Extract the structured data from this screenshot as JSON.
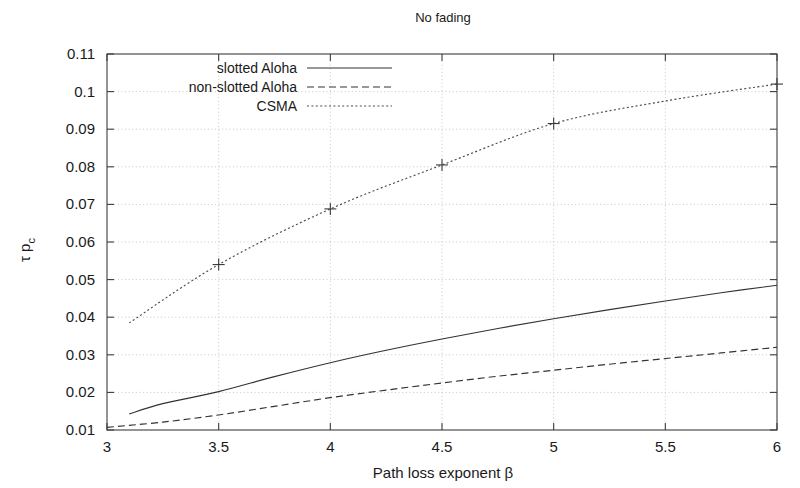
{
  "chart_data": {
    "type": "line",
    "title": "No fading",
    "xlabel": "Path loss exponent β",
    "ylabel": "τ p",
    "ylabel_sub": "c",
    "xlim": [
      3,
      6
    ],
    "ylim": [
      0.01,
      0.11
    ],
    "xticks": [
      "3",
      "3.5",
      "4",
      "4.5",
      "5",
      "5.5",
      "6"
    ],
    "xtick_values": [
      3,
      3.5,
      4,
      4.5,
      5,
      5.5,
      6
    ],
    "yticks": [
      "0.01",
      "0.02",
      "0.03",
      "0.04",
      "0.05",
      "0.06",
      "0.07",
      "0.08",
      "0.09",
      "0.1",
      "0.11"
    ],
    "ytick_values": [
      0.01,
      0.02,
      0.03,
      0.04,
      0.05,
      0.06,
      0.07,
      0.08,
      0.09,
      0.1,
      0.11
    ],
    "grid": true,
    "legend_position": "top-center-inside",
    "series": [
      {
        "name": "slotted Aloha",
        "style": "solid",
        "marker": "none",
        "x": [
          3.1,
          3.25,
          3.5,
          3.75,
          4.0,
          4.25,
          4.5,
          4.75,
          5.0,
          5.25,
          5.5,
          5.75,
          6.0
        ],
        "values": [
          0.0143,
          0.017,
          0.0202,
          0.0242,
          0.0279,
          0.0312,
          0.0342,
          0.037,
          0.0396,
          0.042,
          0.0443,
          0.0465,
          0.0485
        ]
      },
      {
        "name": "non-slotted Aloha",
        "style": "dashed",
        "marker": "none",
        "x": [
          3.0,
          3.25,
          3.5,
          3.75,
          4.0,
          4.25,
          4.5,
          4.75,
          5.0,
          5.25,
          5.5,
          5.75,
          6.0
        ],
        "values": [
          0.0107,
          0.0121,
          0.014,
          0.0163,
          0.0186,
          0.0206,
          0.0225,
          0.0243,
          0.0259,
          0.0275,
          0.029,
          0.0305,
          0.032
        ]
      },
      {
        "name": "CSMA",
        "style": "dotted",
        "marker": "plus",
        "x": [
          3.1,
          3.5,
          4.0,
          4.5,
          5.0,
          5.5,
          6.0
        ],
        "values": [
          0.0385,
          0.054,
          0.0688,
          0.0805,
          0.0915,
          0.0975,
          0.102
        ],
        "marker_x": [
          3.5,
          4.0,
          4.5,
          5.0,
          6.0
        ],
        "marker_values": [
          0.054,
          0.0688,
          0.0805,
          0.0915,
          0.102
        ]
      }
    ],
    "legend_entries": [
      {
        "label": "slotted Aloha",
        "style": "solid"
      },
      {
        "label": "non-slotted Aloha",
        "style": "dashed"
      },
      {
        "label": "CSMA",
        "style": "dotted"
      }
    ],
    "colors": {
      "axis": "#3c3c3c",
      "grid": "#b9b9b9",
      "series": "#333333",
      "background": "#ffffff"
    }
  }
}
